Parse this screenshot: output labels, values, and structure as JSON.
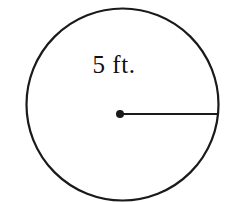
{
  "figure": {
    "name": "circle-with-radius-diagram",
    "shape": "circle",
    "background_color": "#ffffff",
    "ink_color": "#1a1a1a",
    "label": "5 ft.",
    "label_value": "5",
    "label_unit": "ft.",
    "measurement_type": "radius",
    "circle": {
      "center_x": 122.5,
      "center_y": 104.5,
      "radius": 96,
      "stroke_width": 2.2
    },
    "center_dot": {
      "x": 120,
      "y": 114,
      "radius": 4
    },
    "radius_line": {
      "x1": 120,
      "y1": 114,
      "x2": 218,
      "y2": 114,
      "stroke_width": 2.2
    }
  }
}
